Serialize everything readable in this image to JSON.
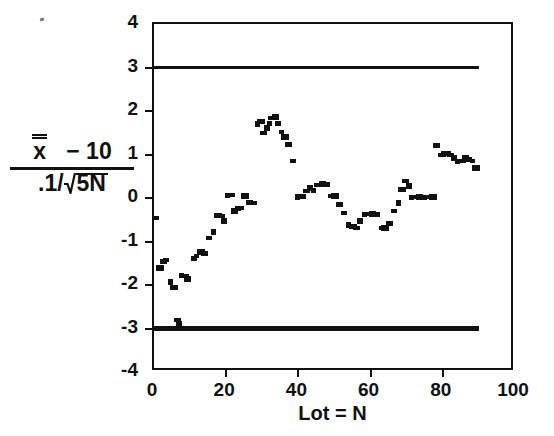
{
  "chart_data": {
    "type": "scatter",
    "title": "",
    "subtitle": "",
    "xlabel": "Lot = N",
    "ylabel_text": "(x̿ − 10) / (.1/sqrt(5N))",
    "ylabel_parts": {
      "numerator_var": "x",
      "numerator_rest": "− 10",
      "denominator_prefix": ".1/",
      "denominator_radicand": "5N"
    },
    "xlim": [
      0,
      100
    ],
    "ylim": [
      -4,
      4
    ],
    "xticks": [
      0,
      20,
      40,
      60,
      80,
      100
    ],
    "xticklabels": [
      "0",
      "20",
      "40",
      "60",
      "80",
      "100"
    ],
    "yticks": [
      4,
      3,
      2,
      1,
      0,
      -1,
      -2,
      -3,
      -4
    ],
    "yticklabels": [
      "4",
      "3",
      "2",
      "1",
      "0",
      "-1",
      "-2",
      "-3",
      "-4"
    ],
    "grid": false,
    "legend": null,
    "marker": "square",
    "marker_color": "#111111",
    "reference_lines": [
      {
        "name": "upper-control-limit",
        "value": 3,
        "x_start": 0,
        "x_end": 90,
        "thickness": 3,
        "color": "#111111"
      },
      {
        "name": "lower-control-limit",
        "value": -3,
        "x_start": 0,
        "x_end": 90,
        "thickness": 5,
        "color": "#111111"
      }
    ],
    "series": [
      {
        "name": "standardized lot mean",
        "x": [
          0.6,
          1.6,
          2.6,
          3.4,
          4.6,
          5.6,
          6.4,
          7.0,
          7.6,
          8.6,
          9.4,
          11.0,
          11.8,
          13.0,
          14.0,
          15.2,
          16.6,
          17.8,
          18.6,
          19.4,
          20.4,
          21.4,
          22.3,
          23.2,
          24.2,
          25.2,
          26.4,
          27.6,
          28.6,
          29.6,
          30.4,
          31.2,
          32.0,
          32.8,
          33.6,
          34.4,
          35.2,
          36.2,
          37.2,
          38.6,
          39.8,
          41.0,
          42.2,
          43.2,
          44.2,
          45.4,
          46.6,
          47.8,
          49.0,
          50.2,
          51.4,
          52.6,
          53.8,
          55.0,
          56.2,
          57.2,
          58.2,
          59.4,
          60.6,
          61.8,
          63.0,
          64.0,
          65.2,
          66.4,
          67.6,
          68.6,
          69.6,
          70.6,
          71.4,
          72.4,
          73.6,
          74.8,
          76.0,
          77.2,
          78.2,
          79.4,
          80.2,
          81.2,
          82.2,
          83.2,
          84.2,
          85.2,
          86.2,
          87.2,
          88.2,
          89.2
        ],
        "y": [
          -0.45,
          -1.62,
          -1.47,
          -1.43,
          -1.93,
          -2.05,
          -2.8,
          -2.9,
          -1.78,
          -1.8,
          -1.86,
          -1.4,
          -1.33,
          -1.23,
          -1.28,
          -0.93,
          -0.78,
          -0.4,
          -0.42,
          -0.52,
          0.05,
          0.07,
          -0.3,
          -0.25,
          -0.22,
          0.05,
          -0.1,
          -0.12,
          1.7,
          1.76,
          1.5,
          1.62,
          1.72,
          1.84,
          1.86,
          1.72,
          1.52,
          1.4,
          1.22,
          0.86,
          0.02,
          0.03,
          0.17,
          0.22,
          0.18,
          0.3,
          0.33,
          0.32,
          0.05,
          0.04,
          -0.15,
          -0.35,
          -0.62,
          -0.66,
          -0.68,
          -0.52,
          -0.38,
          -0.37,
          -0.37,
          -0.37,
          -0.7,
          -0.7,
          -0.58,
          -0.3,
          -0.12,
          0.2,
          0.4,
          0.28,
          0.02,
          0.02,
          0.02,
          0.02,
          0.02,
          0.02,
          1.2,
          1.0,
          1.02,
          1.03,
          1.0,
          0.92,
          0.84,
          0.86,
          0.92,
          0.88,
          0.84,
          0.68
        ]
      }
    ]
  },
  "axes": {
    "x_axis_name": "lot-number-axis",
    "y_axis_name": "standardized-mean-axis"
  }
}
